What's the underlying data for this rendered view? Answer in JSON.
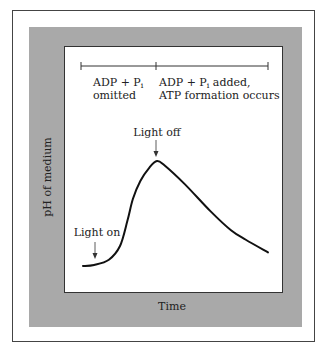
{
  "figure": {
    "y_axis_label": "pH of medium",
    "x_axis_label": "Time",
    "phases": [
      {
        "line1": "ADP + P",
        "sub": "i",
        "line2": "omitted"
      },
      {
        "line1": "ADP + P",
        "sub": "i",
        "line1_suffix": " added,",
        "line2": "ATP formation occurs"
      }
    ],
    "annotations": {
      "light_on": "Light on",
      "light_off": "Light off"
    },
    "colors": {
      "frame_gray": "#a9a9a9",
      "curve": "#111111"
    }
  },
  "chart_data": {
    "type": "line",
    "title": "",
    "xlabel": "Time",
    "ylabel": "pH of medium",
    "x_ticks_shown": false,
    "y_ticks_shown": false,
    "series": [
      {
        "name": "pH",
        "x": [
          0,
          0.06,
          0.14,
          0.2,
          0.24,
          0.27,
          0.31,
          0.36,
          0.4,
          0.44,
          0.55,
          0.69,
          0.8,
          0.88,
          1.0
        ],
        "y": [
          0.0,
          0.01,
          0.06,
          0.19,
          0.43,
          0.64,
          0.81,
          0.94,
          1.0,
          0.96,
          0.78,
          0.52,
          0.34,
          0.25,
          0.13
        ]
      }
    ],
    "events": [
      {
        "label": "Light on",
        "x": 0.06
      },
      {
        "label": "Light off",
        "x": 0.4
      }
    ],
    "xlim": [
      0,
      1
    ],
    "ylim": [
      0,
      1
    ]
  }
}
